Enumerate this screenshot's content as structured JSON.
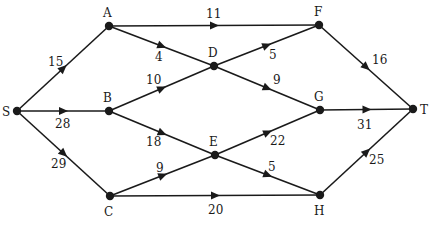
{
  "diagram": {
    "type": "directed-weighted-network",
    "nodes": [
      {
        "id": "S",
        "label": "S",
        "x": 17,
        "y": 111,
        "lx": 2,
        "ly": 116
      },
      {
        "id": "A",
        "label": "A",
        "x": 109,
        "y": 26,
        "lx": 103,
        "ly": 17
      },
      {
        "id": "B",
        "label": "B",
        "x": 109,
        "y": 111,
        "lx": 103,
        "ly": 102
      },
      {
        "id": "C",
        "label": "C",
        "x": 110,
        "y": 196,
        "lx": 104,
        "ly": 216
      },
      {
        "id": "D",
        "label": "D",
        "x": 214,
        "y": 66,
        "lx": 208,
        "ly": 57
      },
      {
        "id": "E",
        "label": "E",
        "x": 215,
        "y": 155,
        "lx": 209,
        "ly": 146
      },
      {
        "id": "F",
        "label": "F",
        "x": 319,
        "y": 25,
        "lx": 314,
        "ly": 16
      },
      {
        "id": "G",
        "label": "G",
        "x": 320,
        "y": 110,
        "lx": 314,
        "ly": 101
      },
      {
        "id": "H",
        "label": "H",
        "x": 320,
        "y": 195,
        "lx": 314,
        "ly": 215
      },
      {
        "id": "T",
        "label": "T",
        "x": 413,
        "y": 109,
        "lx": 420,
        "ly": 114
      }
    ],
    "edges": [
      {
        "from": "S",
        "to": "A",
        "weight": "15",
        "wx": 48,
        "wy": 66
      },
      {
        "from": "S",
        "to": "B",
        "weight": "28",
        "wx": 55,
        "wy": 128
      },
      {
        "from": "S",
        "to": "C",
        "weight": "29",
        "wx": 51,
        "wy": 168
      },
      {
        "from": "A",
        "to": "F",
        "weight": "11",
        "wx": 206,
        "wy": 18
      },
      {
        "from": "A",
        "to": "D",
        "weight": "4",
        "wx": 155,
        "wy": 61
      },
      {
        "from": "D",
        "to": "G",
        "weight": "9",
        "wx": 273,
        "wy": 84
      },
      {
        "from": "B",
        "to": "D",
        "weight": "10",
        "wx": 146,
        "wy": 84
      },
      {
        "from": "D",
        "to": "F",
        "weight": "5",
        "wx": 269,
        "wy": 59
      },
      {
        "from": "B",
        "to": "E",
        "weight": "18",
        "wx": 146,
        "wy": 146
      },
      {
        "from": "E",
        "to": "H",
        "weight": "5",
        "wx": 268,
        "wy": 171
      },
      {
        "from": "C",
        "to": "E",
        "weight": "9",
        "wx": 156,
        "wy": 172
      },
      {
        "from": "E",
        "to": "G",
        "weight": "22",
        "wx": 270,
        "wy": 145
      },
      {
        "from": "C",
        "to": "H",
        "weight": "20",
        "wx": 208,
        "wy": 214
      },
      {
        "from": "F",
        "to": "T",
        "weight": "16",
        "wx": 372,
        "wy": 64
      },
      {
        "from": "G",
        "to": "T",
        "weight": "31",
        "wx": 357,
        "wy": 129
      },
      {
        "from": "H",
        "to": "T",
        "weight": "25",
        "wx": 369,
        "wy": 164
      }
    ]
  },
  "colors": {
    "line": "#1a1a1a",
    "background": "#ffffff"
  }
}
